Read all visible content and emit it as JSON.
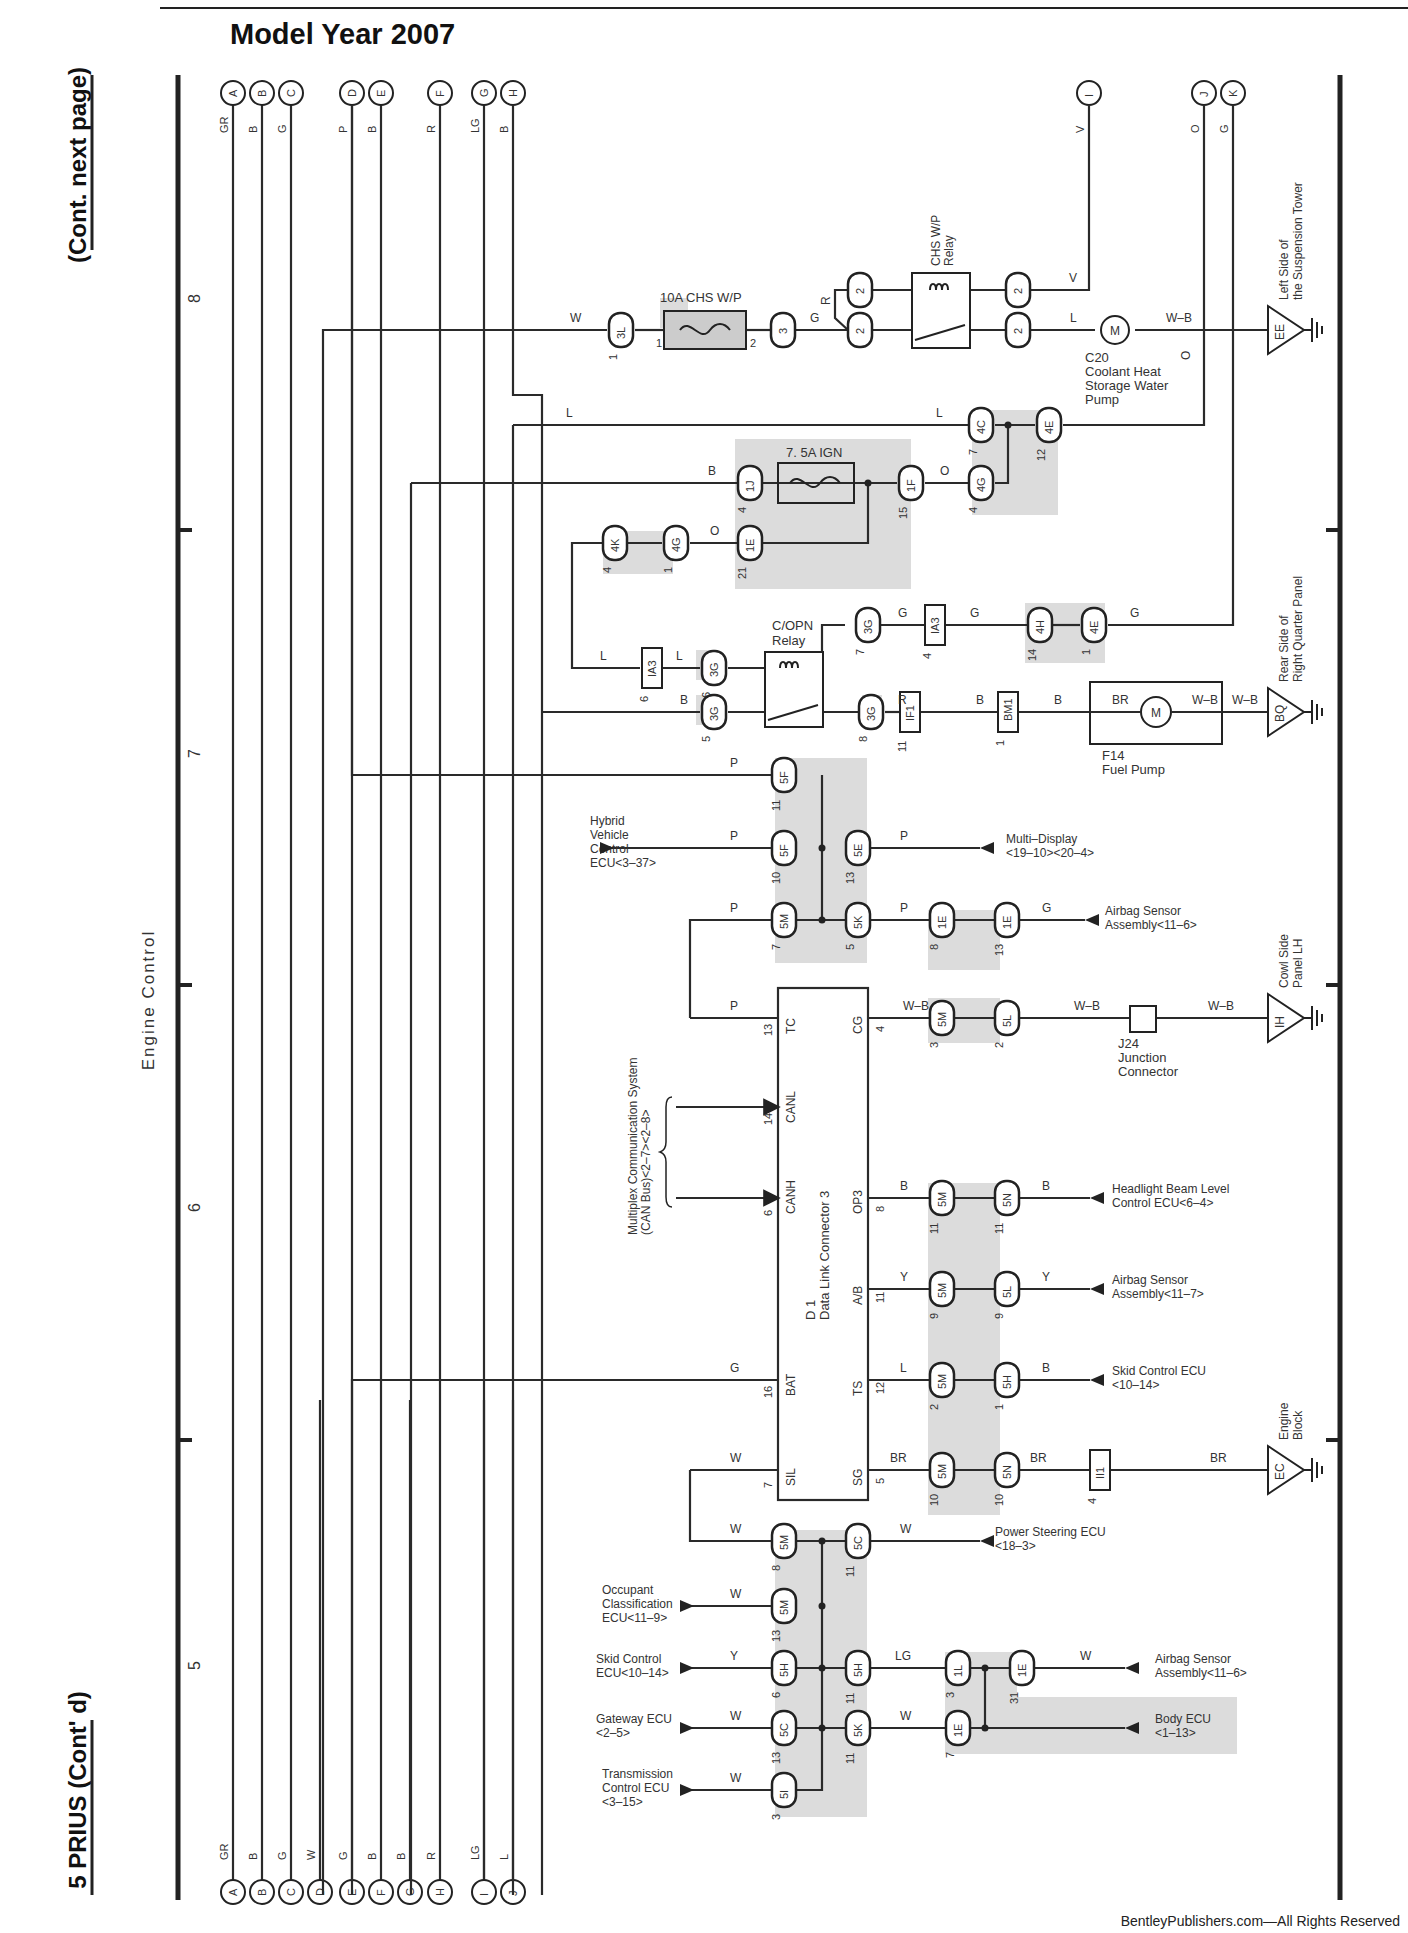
{
  "header": {
    "title": "Model Year 2007",
    "side_top": "(Cont.  next page)",
    "side_bottom": "5  PRIUS (Cont' d)",
    "section_label": "Engine Control",
    "credit": "BentleyPublishers.com—All Rights Reserved"
  },
  "grid_numbers": [
    {
      "label": "8",
      "y": 303
    },
    {
      "label": "7",
      "y": 758
    },
    {
      "label": "6",
      "y": 1212
    },
    {
      "label": "5",
      "y": 1670
    }
  ],
  "grid_ticks": [
    530,
    985,
    1440
  ],
  "top_terminals": [
    {
      "id": "A",
      "x": 233,
      "color": "GR"
    },
    {
      "id": "B",
      "x": 262,
      "color": "B"
    },
    {
      "id": "C",
      "x": 291,
      "color": "G"
    },
    {
      "id": "D",
      "x": 352,
      "color": "P"
    },
    {
      "id": "E",
      "x": 381,
      "color": "B"
    },
    {
      "id": "F",
      "x": 440,
      "color": "R"
    },
    {
      "id": "G",
      "x": 484,
      "color": "LG"
    },
    {
      "id": "H",
      "x": 513,
      "color": "B"
    },
    {
      "id": "I",
      "x": 1089,
      "color": "V"
    },
    {
      "id": "J",
      "x": 1204,
      "color": "O"
    },
    {
      "id": "K",
      "x": 1233,
      "color": "G"
    }
  ],
  "bottom_terminals": [
    {
      "id": "A",
      "x": 233,
      "color": "GR"
    },
    {
      "id": "B",
      "x": 262,
      "color": "B"
    },
    {
      "id": "C",
      "x": 291,
      "color": "G"
    },
    {
      "id": "D",
      "x": 320,
      "color": "W"
    },
    {
      "id": "E",
      "x": 352,
      "color": "G"
    },
    {
      "id": "F",
      "x": 381,
      "color": "B"
    },
    {
      "id": "G",
      "x": 410,
      "color": "B"
    },
    {
      "id": "H",
      "x": 440,
      "color": "R"
    },
    {
      "id": "I",
      "x": 484,
      "color": "LG"
    },
    {
      "id": "J",
      "x": 513,
      "color": "L"
    }
  ],
  "components": {
    "fuse_chs": {
      "label": "10A CHS W/P",
      "pin_in": "1",
      "pin_out": "2"
    },
    "chs_relay": {
      "label1": "CHS W/P",
      "label2": "Relay",
      "pins": [
        "1",
        "2",
        "3",
        "5"
      ]
    },
    "coolant_pump": {
      "ref": "C20",
      "lines": [
        "Coolant Heat",
        "Storage Water",
        "Pump"
      ],
      "pin_in": "2",
      "pin_out": "1",
      "symbol": "M"
    },
    "fuse_ign": {
      "label": "7. 5A IGN"
    },
    "copn_relay": {
      "label1": "C/OPN",
      "label2": "Relay"
    },
    "fuel_pump": {
      "ref": "F14",
      "name": "Fuel Pump",
      "pins": [
        "3",
        "4",
        "5",
        "7"
      ],
      "symbol": "M"
    },
    "dlc": {
      "ref": "D 1",
      "name": "Data Link Connector 3",
      "left_pins": [
        {
          "name": "TC",
          "num": "13"
        },
        {
          "name": "CANL",
          "num": "14"
        },
        {
          "name": "CANH",
          "num": "6"
        },
        {
          "name": "BAT",
          "num": "16"
        },
        {
          "name": "SIL",
          "num": "7"
        }
      ],
      "right_pins": [
        {
          "name": "CG",
          "num": "4"
        },
        {
          "name": "OP3",
          "num": "8"
        },
        {
          "name": "A/B",
          "num": "11"
        },
        {
          "name": "TS",
          "num": "12"
        },
        {
          "name": "SG",
          "num": "5"
        }
      ]
    },
    "j24": {
      "ref": "J24",
      "lines": [
        "Junction",
        "Connector"
      ],
      "pin": "A"
    },
    "can_bus": {
      "line1": "Multiplex Communication System",
      "line2": "(CAN Bus)<2–7><2–8>"
    }
  },
  "grounds": [
    {
      "code": "EE",
      "line1": "Left Side of",
      "line2": "the Suspension Tower"
    },
    {
      "code": "BQ",
      "line1": "Rear Side of",
      "line2": "Right Quarter Panel"
    },
    {
      "code": "IH",
      "line1": "Cowl Side",
      "line2": "Panel LH"
    },
    {
      "code": "EC",
      "line1": "Engine",
      "line2": "Block"
    }
  ],
  "connectors": {
    "c_3L": {
      "code": "3L",
      "pin": "1"
    },
    "c_3": {
      "code": "3",
      "pin": ""
    },
    "c_2a": {
      "code": "2",
      "pin": ""
    },
    "c_2b": {
      "code": "2",
      "pin": ""
    },
    "c_2c": {
      "code": "2",
      "pin": ""
    },
    "c_2d": {
      "code": "2",
      "pin": ""
    },
    "c_4C": {
      "code": "4C",
      "pin": "7"
    },
    "c_4E_top": {
      "code": "4E",
      "pin": "12"
    },
    "c_1J": {
      "code": "1J",
      "pin": "4"
    },
    "c_1F": {
      "code": "1F",
      "pin": "15"
    },
    "c_4G_r": {
      "code": "4G",
      "pin": "4"
    },
    "c_4K": {
      "code": "4K",
      "pin": "4"
    },
    "c_4G_l": {
      "code": "4G",
      "pin": "1"
    },
    "c_1E_ign": {
      "code": "1E",
      "pin": "21"
    },
    "c_IA3_a": {
      "code": "IA3",
      "pin": "6"
    },
    "c_3G_6": {
      "code": "3G",
      "pin": "6"
    },
    "c_3G_5": {
      "code": "3G",
      "pin": "5"
    },
    "c_3G_7": {
      "code": "3G",
      "pin": "7"
    },
    "c_IA3_b": {
      "code": "IA3",
      "pin": "4"
    },
    "c_4H": {
      "code": "4H",
      "pin": "14"
    },
    "c_4E_g": {
      "code": "4E",
      "pin": "1"
    },
    "c_3G_8": {
      "code": "3G",
      "pin": "8"
    },
    "c_IF1": {
      "code": "IF1",
      "pin": "11"
    },
    "c_BM1": {
      "code": "BM1",
      "pin": "1"
    },
    "c_5F_11": {
      "code": "5F",
      "pin": "11"
    },
    "c_5F_10": {
      "code": "5F",
      "pin": "10"
    },
    "c_5E": {
      "code": "5E",
      "pin": "13"
    },
    "c_5M_7": {
      "code": "5M",
      "pin": "7"
    },
    "c_5K_5": {
      "code": "5K",
      "pin": "5"
    },
    "c_1E_8": {
      "code": "1E",
      "pin": "8"
    },
    "c_1E_13": {
      "code": "1E",
      "pin": "13"
    },
    "c_5M_3": {
      "code": "5M",
      "pin": "3"
    },
    "c_5L_2": {
      "code": "5L",
      "pin": "2"
    },
    "c_5M_11": {
      "code": "5M",
      "pin": "11"
    },
    "c_5N_11": {
      "code": "5N",
      "pin": "11"
    },
    "c_5M_9": {
      "code": "5M",
      "pin": "9"
    },
    "c_5L_9": {
      "code": "5L",
      "pin": "9"
    },
    "c_5M_2": {
      "code": "5M",
      "pin": "2"
    },
    "c_5H_1": {
      "code": "5H",
      "pin": "1"
    },
    "c_5M_10": {
      "code": "5M",
      "pin": "10"
    },
    "c_5N_10": {
      "code": "5N",
      "pin": "10"
    },
    "c_II1": {
      "code": "II1",
      "pin": "4"
    },
    "c_5M_8": {
      "code": "5M",
      "pin": "8"
    },
    "c_5C_11": {
      "code": "5C",
      "pin": "11"
    },
    "c_5M_13": {
      "code": "5M",
      "pin": "13"
    },
    "c_5H_6": {
      "code": "5H",
      "pin": "6"
    },
    "c_5H_11": {
      "code": "5H",
      "pin": "11"
    },
    "c_1L": {
      "code": "1L",
      "pin": "3"
    },
    "c_1E_31": {
      "code": "1E",
      "pin": "31"
    },
    "c_5C_13": {
      "code": "5C",
      "pin": "13"
    },
    "c_5K_11": {
      "code": "5K",
      "pin": "11"
    },
    "c_1E_7": {
      "code": "1E",
      "pin": "7"
    },
    "c_5I": {
      "code": "5I",
      "pin": "3"
    }
  },
  "external_refs": {
    "hybrid": [
      "Hybrid",
      "Vehicle",
      "Control",
      "ECU<3–37>"
    ],
    "multi_display": [
      "Multi–Display",
      "<19–10><20–4>"
    ],
    "airbag_1": [
      "Airbag Sensor",
      "Assembly<11–6>"
    ],
    "headlight": [
      "Headlight Beam Level",
      "Control ECU<6–4>"
    ],
    "airbag_2": [
      "Airbag Sensor",
      "Assembly<11–7>"
    ],
    "skid_r": [
      "Skid Control ECU",
      "<10–14>"
    ],
    "power_steering": [
      "Power Steering ECU",
      "<18–3>"
    ],
    "occupant": [
      "Occupant",
      "Classification",
      "ECU<11–9>"
    ],
    "skid_l": [
      "Skid Control",
      "ECU<10–14>"
    ],
    "gateway": [
      "Gateway ECU",
      "<2–5>"
    ],
    "transmission": [
      "Transmission",
      "Control ECU",
      "<3–15>"
    ],
    "airbag_3": [
      "Airbag Sensor",
      "Assembly<11–6>"
    ],
    "body": [
      "Body ECU",
      "<1–13>"
    ]
  },
  "wire_colors": {
    "w_chs_in": "W",
    "w_chs_g": "G",
    "w_chs_r": "R",
    "w_chs_v": "V",
    "w_chs_l": "L",
    "w_chs_wb": "W–B",
    "w_j_o": "O",
    "w_4c_l_left": "L",
    "w_4c_l_right": "L",
    "w_ign_b": "B",
    "w_ign_o": "O",
    "w_ign_o2": "O",
    "w_ia3_l1": "L",
    "w_ia3_l2": "L",
    "w_copn_b": "B",
    "w_copn_g1": "G",
    "w_copn_g2": "G",
    "w_k_g": "G",
    "w_copn_r": "R",
    "w_if1_b": "B",
    "w_bm1_b": "B",
    "w_fp_br": "BR",
    "w_fp_wb1": "W–B",
    "w_fp_wb2": "W–B",
    "w_5f_p": "P",
    "w_hv_p": "P",
    "w_md_p": "P",
    "w_5m_p": "P",
    "w_5k_p": "P",
    "w_ab1_g": "G",
    "w_tc_p": "P",
    "w_cg_wb": "W–B",
    "w_j24_wb1": "W–B",
    "w_j24_wb2": "W–B",
    "w_op3_b1": "B",
    "w_op3_b2": "B",
    "w_ab_y1": "Y",
    "w_ab_y2": "Y",
    "w_ts_l": "L",
    "w_ts_b": "B",
    "w_bat_g": "G",
    "w_sil_w": "W",
    "w_sg_br1": "BR",
    "w_sg_br2": "BR",
    "w_sg_br3": "BR",
    "w_ps_w1": "W",
    "w_ps_w2": "W",
    "w_occ_w": "W",
    "w_skid_y": "Y",
    "w_skid_lg": "LG",
    "w_ab3_w": "W",
    "w_gw_w": "W",
    "w_gw_w2": "W",
    "w_tr_w": "W"
  },
  "colors": {
    "line": "#2a2a2a",
    "shade": "#dcdcdc",
    "background": "#ffffff"
  }
}
